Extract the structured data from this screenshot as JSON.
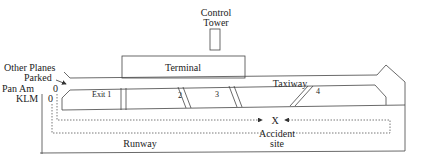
{
  "diagram": {
    "control_tower": {
      "line1": "Control",
      "line2": "Tower"
    },
    "terminal": "Terminal",
    "taxiway": "Taxiway",
    "runway": "Runway",
    "exits": {
      "exit1": "Exit  1",
      "exit2": "2",
      "exit3": "3",
      "exit4": "4"
    },
    "other_planes": {
      "line1": "Other Planes",
      "line2": "Parked"
    },
    "pan_am": {
      "label": "Pan Am",
      "marker": "0"
    },
    "klm": {
      "label": "KLM",
      "marker": "0"
    },
    "accident": {
      "mark": "X",
      "line1": "Accident",
      "line2": "site"
    },
    "colors": {
      "line": "#444444",
      "text": "#222222",
      "background": "#ffffff"
    }
  }
}
